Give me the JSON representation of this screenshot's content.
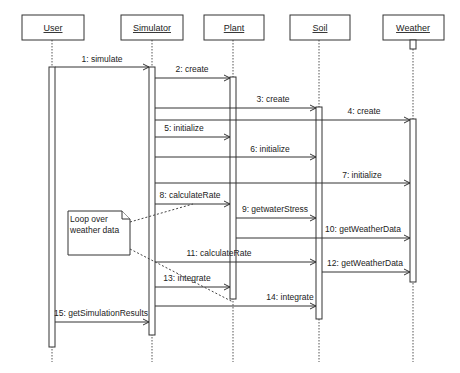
{
  "diagram": {
    "type": "UML sequence diagram",
    "objects": [
      {
        "name": "User",
        "x": 52
      },
      {
        "name": "Simulator",
        "x": 152
      },
      {
        "name": "Plant",
        "x": 233
      },
      {
        "name": "Soil",
        "x": 319
      },
      {
        "name": "Weather",
        "x": 413
      }
    ],
    "messages": [
      {
        "label": "1: simulate",
        "from": "User",
        "to": "Simulator"
      },
      {
        "label": "2: create",
        "from": "Simulator",
        "to": "Plant"
      },
      {
        "label": "3: create",
        "from": "Simulator",
        "to": "Soil"
      },
      {
        "label": "4: create",
        "from": "Simulator",
        "to": "Weather"
      },
      {
        "label": "5: initialize",
        "from": "Simulator",
        "to": "Plant"
      },
      {
        "label": "6: initialize",
        "from": "Simulator",
        "to": "Soil"
      },
      {
        "label": "7: initialize",
        "from": "Simulator",
        "to": "Weather"
      },
      {
        "label": "8: calculateRate",
        "from": "Simulator",
        "to": "Plant"
      },
      {
        "label": "9: getwaterStress",
        "from": "Plant",
        "to": "Soil"
      },
      {
        "label": "10: getWeatherData",
        "from": "Plant",
        "to": "Weather"
      },
      {
        "label": "11: calculateRate",
        "from": "Simulator",
        "to": "Soil"
      },
      {
        "label": "12: getWeatherData",
        "from": "Soil",
        "to": "Weather"
      },
      {
        "label": "13: integrate",
        "from": "Simulator",
        "to": "Plant"
      },
      {
        "label": "14: integrate",
        "from": "Simulator",
        "to": "Soil"
      },
      {
        "label": "15: getSimulationResults",
        "from": "User",
        "to": "Simulator"
      }
    ],
    "note": {
      "line1": "Loop over",
      "line2": "weather data"
    }
  }
}
